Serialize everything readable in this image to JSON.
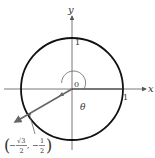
{
  "diagram": {
    "type": "unit-circle",
    "axes": {
      "x_label": "x",
      "y_label": "y",
      "origin_label": "0",
      "x_tick_label": "1",
      "y_tick_label": "1"
    },
    "angle": {
      "label": "θ"
    },
    "point": {
      "label_open": "(",
      "label_neg1": "−",
      "label_sqrt3": "√3",
      "label_den1": "2",
      "label_comma": ", −",
      "label_num2": "1",
      "label_den2": "2",
      "label_close": ")",
      "value": "(−√3/2, −1/2)"
    },
    "colors": {
      "circle": "#111111",
      "axes": "#555555",
      "ray": "#666666",
      "text": "#333333"
    }
  }
}
